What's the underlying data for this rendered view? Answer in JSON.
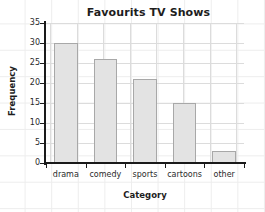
{
  "chart_data": {
    "type": "bar",
    "title": "Favourits TV Shows",
    "xlabel": "Category",
    "ylabel": "Frequency",
    "categories": [
      "drama",
      "comedy",
      "sports",
      "cartoons",
      "other"
    ],
    "values": [
      30,
      26,
      21,
      15,
      3
    ],
    "ylim": [
      0,
      35
    ],
    "ytick_step": 5,
    "yticks": [
      0,
      5,
      10,
      15,
      20,
      25,
      30,
      35
    ],
    "ytick_labels": [
      "0",
      "5",
      "10",
      "15",
      "20",
      "25",
      "30",
      "35"
    ],
    "grid": true,
    "legend": false,
    "legend_position": "none",
    "bar_fill_color": "#e3e3e3",
    "bar_border_color": "#a8a8a8",
    "axis_color": "#1a1a1a",
    "gridline_color": "#dcdcdc",
    "page_grid_color": "#ededed",
    "background_color": "#ffffff"
  }
}
